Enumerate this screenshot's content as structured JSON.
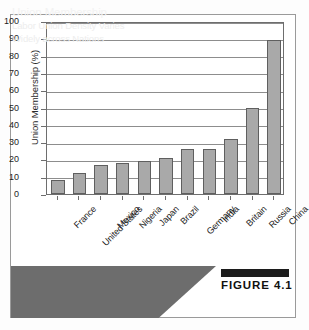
{
  "figure": {
    "tag_label": "FIGURE 4.1",
    "caption_title": "Union Membership",
    "caption_line_1": "Labor Union Density Varies",
    "caption_line_2": "Widely across Nations"
  },
  "colors": {
    "bar_fill": "#a9a9a9",
    "bar_stroke": "#5f5f5f",
    "banner_bg": "#6d6d6d",
    "banner_text": "#f2f2f2",
    "gridline": "#8d8d8d",
    "tag_bar": "#1c1c1c"
  },
  "chart_data": {
    "type": "bar",
    "title": "Union Membership",
    "subtitle": "Labor Union Density Varies Widely across Nations",
    "xlabel": "",
    "ylabel": "Union Membership (%)",
    "ylim": [
      0,
      100
    ],
    "ytick_step": 10,
    "yticks": [
      0,
      10,
      20,
      30,
      40,
      50,
      60,
      70,
      80,
      90,
      100
    ],
    "ytick_labels": [
      "0",
      "10",
      "20",
      "30",
      "40",
      "50",
      "60",
      "70",
      "80",
      "90",
      "100"
    ],
    "grid": true,
    "legend": false,
    "categories": [
      "France",
      "United States",
      "Mexico",
      "Nigeria",
      "Japan",
      "Brazil",
      "Germany",
      "India",
      "Britain",
      "Russia",
      "China"
    ],
    "values": [
      8,
      12,
      17,
      18,
      19,
      21,
      26,
      26,
      32,
      50,
      89
    ]
  }
}
